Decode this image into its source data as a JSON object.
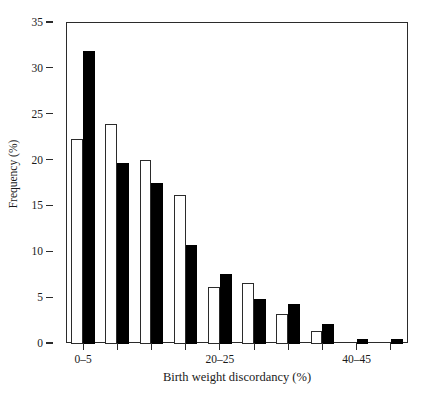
{
  "chart_data": {
    "type": "bar",
    "title": "",
    "xlabel": "Birth weight discordancy (%)",
    "ylabel": "Frequency (%)",
    "categories": [
      "0–5",
      "5–10",
      "10–15",
      "15–20",
      "20–25",
      "25–30",
      "30–35",
      "35–40",
      "40–45",
      "45–50"
    ],
    "visible_tick_labels": [
      {
        "index": 0,
        "label": "0–5"
      },
      {
        "index": 4,
        "label": "20–25"
      },
      {
        "index": 8,
        "label": "40–45"
      }
    ],
    "series": [
      {
        "name": "open",
        "fill": "#ffffff",
        "values": [
          22.3,
          24.0,
          20.1,
          16.2,
          6.2,
          6.7,
          3.3,
          1.4,
          0.0,
          0.0
        ]
      },
      {
        "name": "filled",
        "fill": "#000000",
        "values": [
          32.0,
          19.7,
          17.6,
          10.8,
          7.6,
          4.9,
          4.4,
          2.2,
          0.5,
          0.5
        ]
      }
    ],
    "ylim": [
      0,
      35
    ],
    "yticks": [
      0,
      5,
      10,
      15,
      20,
      25,
      30,
      35
    ],
    "ytick_labels": [
      "0",
      "5",
      "10",
      "15",
      "20",
      "25",
      "30",
      "35"
    ],
    "grid": false,
    "legend": "none",
    "axis_color": "#2b2b2b",
    "background": "#ffffff"
  }
}
